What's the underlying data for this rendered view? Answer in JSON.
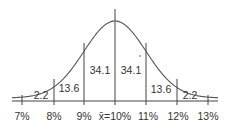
{
  "chart_data": {
    "type": "area",
    "title": "",
    "subtitle": "Normal distribution curve with percentage of area between standard deviations",
    "xlabel": "",
    "ylabel": "",
    "x_ticks": [
      "7%",
      "8%",
      "9%",
      "x̄=10%",
      "11%",
      "12%",
      "13%"
    ],
    "x_values": [
      7,
      8,
      9,
      10,
      11,
      12,
      13
    ],
    "mean": 10,
    "std_dev": 1,
    "regions": [
      {
        "from": 7,
        "to": 8,
        "percent": 2.2,
        "label": "2.2"
      },
      {
        "from": 8,
        "to": 9,
        "percent": 13.6,
        "label": "13.6"
      },
      {
        "from": 9,
        "to": 10,
        "percent": 34.1,
        "label": "34.1"
      },
      {
        "from": 10,
        "to": 11,
        "percent": 34.1,
        "label": "34.1"
      },
      {
        "from": 11,
        "to": 12,
        "percent": 13.6,
        "label": "13.6"
      },
      {
        "from": 12,
        "to": 13,
        "percent": 2.2,
        "label": "2.2"
      }
    ],
    "grid": false,
    "legend": null
  },
  "labels": {
    "ticks": [
      "7%",
      "8%",
      "9%",
      "x̄=10%",
      "11%",
      "12%",
      "13%"
    ],
    "regions": [
      "2.2",
      "13.6",
      "34.1",
      "34.1",
      "13.6",
      "2.2"
    ]
  },
  "colors": {
    "curve": "#555555",
    "lines": "#444444",
    "text": "#333333",
    "background": "#ffffff"
  }
}
